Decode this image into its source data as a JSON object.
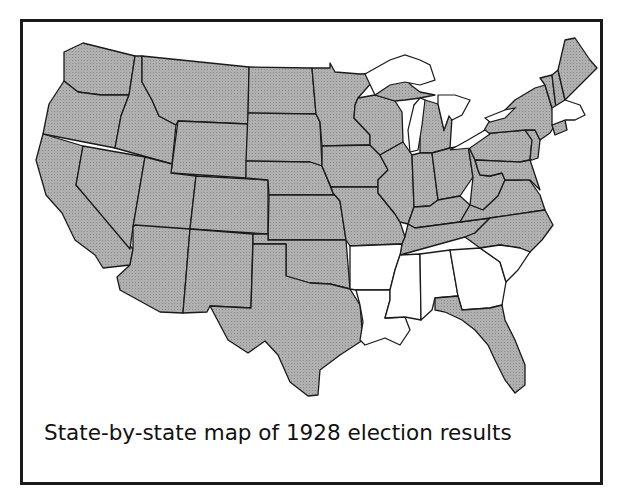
{
  "map": {
    "caption": "State-by-state map of 1928 election results",
    "fill_colors": {
      "shaded": "#a8a8a8",
      "unshaded": "#ffffff",
      "border": "#1a1a1a"
    },
    "legend": [],
    "unshaded_states": [
      "Arkansas",
      "Louisiana",
      "Mississippi",
      "Alabama",
      "Georgia",
      "South Carolina",
      "Massachusetts",
      "Rhode Island"
    ],
    "shaded_states_note": "All other contiguous states shaded gray"
  }
}
